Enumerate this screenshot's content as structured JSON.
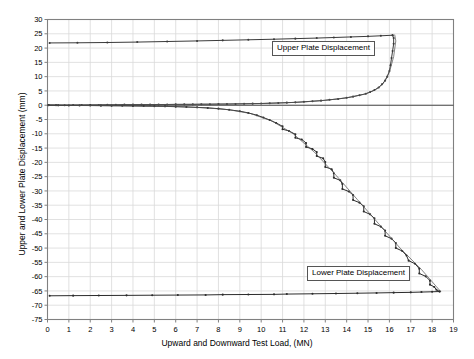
{
  "chart_data": {
    "type": "line",
    "title": "",
    "xlabel": "Upward and Downward Test Load, (MN)",
    "ylabel": "Upper and Lower Plate Displacement (mm)",
    "xlim": [
      0,
      19
    ],
    "ylim": [
      -75,
      30
    ],
    "xticks": [
      0,
      1,
      2,
      3,
      4,
      5,
      6,
      7,
      8,
      9,
      10,
      11,
      12,
      13,
      14,
      15,
      16,
      17,
      18,
      19
    ],
    "yticks": [
      30,
      25,
      20,
      15,
      10,
      5,
      0,
      -5,
      -10,
      -15,
      -20,
      -25,
      -30,
      -35,
      -40,
      -45,
      -50,
      -55,
      -60,
      -65,
      -70,
      -75
    ],
    "xtick_labels": [
      "0",
      "1",
      "2",
      "3",
      "4",
      "5",
      "6",
      "7",
      "8",
      "9",
      "10",
      "11",
      "12",
      "13",
      "14",
      "15",
      "16",
      "17",
      "18",
      "19"
    ],
    "ytick_labels": [
      "30",
      "25",
      "20",
      "15",
      "10",
      "5",
      "0",
      "-5",
      "-10",
      "-15",
      "-20",
      "-25",
      "-30",
      "-35",
      "-40",
      "-45",
      "-50",
      "-55",
      "-60",
      "-65",
      "-70",
      "-75"
    ],
    "grid": true,
    "legend_position": "inside-annotations",
    "annotations": [
      {
        "text": "Upper Plate Displacement",
        "x": 11.2,
        "y": 17.5
      },
      {
        "text": "Lower Plate Displacement",
        "x": 13.0,
        "y": -59.0
      }
    ],
    "series": [
      {
        "name": "Upper Plate Displacement - loading",
        "role": "measured",
        "color": "#3a3a3a",
        "points": [
          [
            0.05,
            0.05
          ],
          [
            0.4,
            0.02
          ],
          [
            0.8,
            0.0
          ],
          [
            1.2,
            0.05
          ],
          [
            1.6,
            0.05
          ],
          [
            2.0,
            0.1
          ],
          [
            2.4,
            0.1
          ],
          [
            2.8,
            0.15
          ],
          [
            3.2,
            0.15
          ],
          [
            3.6,
            0.2
          ],
          [
            4.0,
            0.2
          ],
          [
            4.4,
            0.22
          ],
          [
            4.8,
            0.22
          ],
          [
            5.2,
            0.25
          ],
          [
            5.6,
            0.25
          ],
          [
            6.0,
            0.3
          ],
          [
            6.4,
            0.3
          ],
          [
            6.8,
            0.3
          ],
          [
            7.2,
            0.35
          ],
          [
            7.6,
            0.35
          ],
          [
            8.0,
            0.4
          ],
          [
            8.4,
            0.4
          ],
          [
            8.8,
            0.45
          ],
          [
            9.2,
            0.5
          ],
          [
            9.6,
            0.55
          ],
          [
            10.0,
            0.6
          ],
          [
            10.4,
            0.7
          ],
          [
            10.8,
            0.8
          ],
          [
            11.2,
            0.9
          ],
          [
            11.6,
            1.0
          ],
          [
            12.0,
            1.2
          ],
          [
            12.4,
            1.4
          ],
          [
            12.8,
            1.6
          ],
          [
            13.2,
            1.9
          ],
          [
            13.6,
            2.2
          ],
          [
            14.0,
            2.6
          ],
          [
            14.3,
            3.0
          ],
          [
            14.6,
            3.5
          ],
          [
            14.9,
            4.0
          ],
          [
            15.1,
            4.6
          ],
          [
            15.3,
            5.3
          ],
          [
            15.5,
            6.2
          ],
          [
            15.65,
            7.3
          ],
          [
            15.8,
            8.6
          ],
          [
            15.9,
            10.0
          ],
          [
            16.0,
            12.0
          ],
          [
            16.05,
            14.0
          ],
          [
            16.1,
            16.5
          ],
          [
            16.15,
            19.0
          ],
          [
            16.2,
            21.5
          ],
          [
            16.2,
            23.5
          ],
          [
            16.15,
            24.5
          ]
        ]
      },
      {
        "name": "Upper Plate Displacement - unload/rebound",
        "role": "measured",
        "color": "#3a3a3a",
        "points": [
          [
            16.15,
            24.5
          ],
          [
            15.6,
            24.3
          ],
          [
            15.0,
            24.1
          ],
          [
            14.2,
            23.9
          ],
          [
            13.4,
            23.7
          ],
          [
            12.6,
            23.5
          ],
          [
            11.6,
            23.3
          ],
          [
            10.6,
            23.1
          ],
          [
            9.4,
            22.9
          ],
          [
            8.2,
            22.7
          ],
          [
            7.0,
            22.5
          ],
          [
            5.6,
            22.3
          ],
          [
            4.2,
            22.1
          ],
          [
            2.8,
            21.95
          ],
          [
            1.4,
            21.85
          ],
          [
            0.1,
            21.8
          ]
        ]
      },
      {
        "name": "Upper Plate Displacement - fitted",
        "role": "fitted",
        "color": "#555555",
        "points": [
          [
            0.0,
            0.0
          ],
          [
            2.0,
            0.08
          ],
          [
            4.0,
            0.18
          ],
          [
            6.0,
            0.28
          ],
          [
            8.0,
            0.4
          ],
          [
            10.0,
            0.6
          ],
          [
            11.0,
            0.8
          ],
          [
            12.0,
            1.15
          ],
          [
            13.0,
            1.7
          ],
          [
            14.0,
            2.6
          ],
          [
            14.8,
            3.8
          ],
          [
            15.3,
            5.2
          ],
          [
            15.7,
            7.4
          ],
          [
            16.0,
            11.5
          ],
          [
            16.2,
            17.0
          ],
          [
            16.3,
            22.5
          ],
          [
            16.25,
            24.6
          ]
        ]
      },
      {
        "name": "Lower Plate Displacement - loading",
        "role": "measured",
        "color": "#2b2b2b",
        "points": [
          [
            0.05,
            0.0
          ],
          [
            0.5,
            -0.05
          ],
          [
            1.0,
            -0.1
          ],
          [
            1.5,
            -0.1
          ],
          [
            2.0,
            -0.12
          ],
          [
            2.5,
            -0.15
          ],
          [
            3.0,
            -0.18
          ],
          [
            3.5,
            -0.2
          ],
          [
            4.0,
            -0.25
          ],
          [
            4.5,
            -0.3
          ],
          [
            5.0,
            -0.35
          ],
          [
            5.5,
            -0.4
          ],
          [
            6.0,
            -0.5
          ],
          [
            6.5,
            -0.6
          ],
          [
            7.0,
            -0.75
          ],
          [
            7.5,
            -0.95
          ],
          [
            8.0,
            -1.2
          ],
          [
            8.5,
            -1.6
          ],
          [
            9.0,
            -2.1
          ],
          [
            9.4,
            -2.7
          ],
          [
            9.8,
            -3.5
          ],
          [
            10.1,
            -4.3
          ],
          [
            10.4,
            -5.2
          ],
          [
            10.7,
            -6.2
          ],
          [
            11.0,
            -7.4
          ],
          [
            11.0,
            -8.4
          ],
          [
            11.3,
            -9.0
          ],
          [
            11.6,
            -10.2
          ],
          [
            11.6,
            -11.4
          ],
          [
            11.9,
            -12.0
          ],
          [
            12.1,
            -13.2
          ],
          [
            12.1,
            -14.6
          ],
          [
            12.4,
            -15.3
          ],
          [
            12.6,
            -16.4
          ],
          [
            12.6,
            -17.8
          ],
          [
            12.9,
            -18.6
          ],
          [
            13.0,
            -19.9
          ],
          [
            13.0,
            -21.6
          ],
          [
            13.3,
            -22.4
          ],
          [
            13.4,
            -23.8
          ],
          [
            13.4,
            -25.4
          ],
          [
            13.7,
            -26.3
          ],
          [
            13.8,
            -27.6
          ],
          [
            13.8,
            -29.3
          ],
          [
            14.1,
            -30.2
          ],
          [
            14.3,
            -31.4
          ],
          [
            14.3,
            -33.2
          ],
          [
            14.6,
            -34.1
          ],
          [
            14.8,
            -35.4
          ],
          [
            14.8,
            -37.2
          ],
          [
            15.1,
            -38.2
          ],
          [
            15.3,
            -39.6
          ],
          [
            15.3,
            -41.5
          ],
          [
            15.6,
            -42.5
          ],
          [
            15.8,
            -43.9
          ],
          [
            15.8,
            -45.7
          ],
          [
            16.1,
            -46.7
          ],
          [
            16.3,
            -48.2
          ],
          [
            16.3,
            -50.0
          ],
          [
            16.6,
            -51.0
          ],
          [
            16.8,
            -52.6
          ],
          [
            16.9,
            -54.4
          ],
          [
            17.2,
            -55.5
          ],
          [
            17.4,
            -57.2
          ],
          [
            17.4,
            -58.9
          ],
          [
            17.7,
            -59.9
          ],
          [
            17.9,
            -61.4
          ],
          [
            17.9,
            -62.8
          ],
          [
            18.1,
            -63.6
          ],
          [
            18.2,
            -64.6
          ],
          [
            18.35,
            -65.2
          ]
        ]
      },
      {
        "name": "Lower Plate Displacement - fitted",
        "role": "fitted",
        "color": "#555555",
        "points": [
          [
            0.0,
            0.0
          ],
          [
            2.0,
            -0.1
          ],
          [
            4.0,
            -0.25
          ],
          [
            6.0,
            -0.5
          ],
          [
            7.5,
            -0.95
          ],
          [
            8.5,
            -1.6
          ],
          [
            9.5,
            -2.9
          ],
          [
            10.5,
            -5.5
          ],
          [
            11.5,
            -10.0
          ],
          [
            12.5,
            -16.5
          ],
          [
            13.5,
            -24.5
          ],
          [
            14.5,
            -33.0
          ],
          [
            15.5,
            -41.5
          ],
          [
            16.5,
            -50.0
          ],
          [
            17.5,
            -57.5
          ],
          [
            18.2,
            -63.5
          ],
          [
            18.4,
            -65.2
          ]
        ]
      },
      {
        "name": "Lower Plate Displacement - unload/rebound",
        "role": "measured",
        "color": "#2b2b2b",
        "points": [
          [
            18.35,
            -65.2
          ],
          [
            18.0,
            -65.3
          ],
          [
            17.5,
            -65.4
          ],
          [
            17.0,
            -65.5
          ],
          [
            16.2,
            -65.6
          ],
          [
            15.4,
            -65.7
          ],
          [
            14.5,
            -65.8
          ],
          [
            13.5,
            -65.9
          ],
          [
            12.4,
            -66.0
          ],
          [
            11.2,
            -66.1
          ],
          [
            10.6,
            -66.2
          ],
          [
            9.4,
            -66.25
          ],
          [
            8.2,
            -66.3
          ],
          [
            7.4,
            -66.4
          ],
          [
            6.1,
            -66.45
          ],
          [
            4.9,
            -66.5
          ],
          [
            3.7,
            -66.55
          ],
          [
            2.4,
            -66.6
          ],
          [
            1.2,
            -66.65
          ],
          [
            0.1,
            -66.7
          ]
        ]
      }
    ]
  },
  "style": {
    "grid_color": "#d9d9d9",
    "axis_color": "#808080",
    "zero_line_color": "#4a4a4a",
    "tick_label_color": "#000000",
    "background": "#ffffff"
  }
}
